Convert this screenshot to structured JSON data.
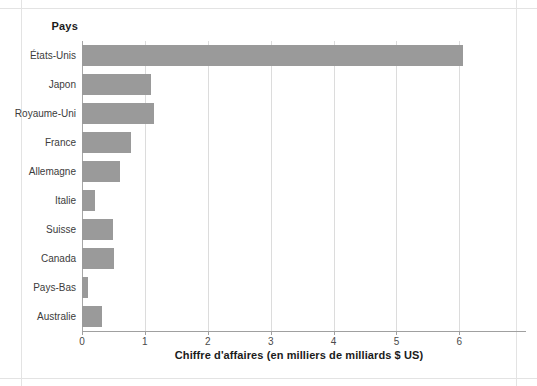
{
  "chart_data": {
    "type": "bar",
    "orientation": "horizontal",
    "title": "",
    "category_header": "Pays",
    "xlabel": "Chiffre d'affaires (en milliers de milliards $ US)",
    "ylabel": "Pays",
    "xlim": [
      0,
      6.9
    ],
    "xticks": [
      0,
      1,
      2,
      3,
      4,
      5,
      6
    ],
    "xtick_labels": [
      "0",
      "1",
      "2",
      "3",
      "4",
      "5",
      "6"
    ],
    "grid": "vertical",
    "legend": "none",
    "bar_color": "#9a9a9a",
    "categories": [
      "États-Unis",
      "Japon",
      "Royaume-Uni",
      "France",
      "Allemagne",
      "Italie",
      "Suisse",
      "Canada",
      "Pays-Bas",
      "Australie"
    ],
    "values": [
      6.05,
      1.1,
      1.15,
      0.78,
      0.6,
      0.2,
      0.5,
      0.51,
      0.1,
      0.32
    ],
    "series": [
      {
        "name": "Chiffre d'affaires",
        "values": [
          6.05,
          1.1,
          1.15,
          0.78,
          0.6,
          0.2,
          0.5,
          0.51,
          0.1,
          0.32
        ]
      }
    ]
  }
}
